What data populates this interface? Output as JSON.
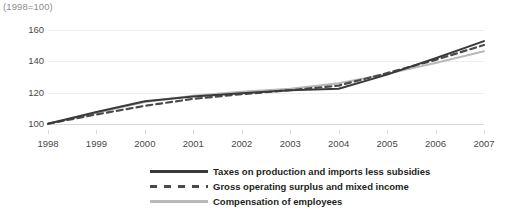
{
  "chart_data": {
    "type": "line",
    "title": "(1998=100)",
    "xlabel": "",
    "ylabel": "",
    "x": [
      1998,
      1999,
      2000,
      2001,
      2002,
      2003,
      2004,
      2005,
      2006,
      2007
    ],
    "xtick_labels": [
      "1998",
      "1999",
      "2000",
      "2001",
      "2002",
      "2003",
      "2004",
      "2005",
      "2006",
      "2007"
    ],
    "ytick_labels": [
      "100",
      "120",
      "140",
      "160"
    ],
    "yticks": [
      100,
      120,
      140,
      160
    ],
    "ylim": [
      96,
      164
    ],
    "xlim": [
      1998,
      2007
    ],
    "grid": true,
    "legend_position": "bottom",
    "series": [
      {
        "name": "Taxes on production and imports less subsidies",
        "style": "solid",
        "color": "#3a3a3a",
        "values": [
          100,
          107.5,
          114.5,
          117.5,
          119.5,
          121.5,
          122.5,
          131.5,
          142.0,
          153.0
        ]
      },
      {
        "name": "Gross operating surplus and mixed income",
        "style": "dashed",
        "color": "#4a4a4a",
        "values": [
          100,
          106.0,
          111.5,
          116.0,
          119.0,
          121.5,
          124.5,
          132.5,
          141.0,
          150.5
        ]
      },
      {
        "name": "Compensation of employees",
        "style": "solid",
        "color": "#b9b9b9",
        "values": [
          100,
          107.0,
          114.0,
          118.0,
          120.5,
          122.5,
          126.0,
          132.0,
          139.0,
          146.5
        ]
      }
    ]
  }
}
